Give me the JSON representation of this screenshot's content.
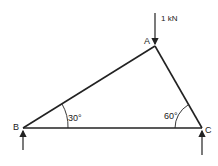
{
  "diagram": {
    "type": "truss",
    "nodes": {
      "A": {
        "label": "A",
        "x": 155,
        "y": 46
      },
      "B": {
        "label": "B",
        "x": 23,
        "y": 128
      },
      "C": {
        "label": "C",
        "x": 202,
        "y": 128
      }
    },
    "members": [
      {
        "from": "A",
        "to": "B"
      },
      {
        "from": "A",
        "to": "C"
      },
      {
        "from": "B",
        "to": "C"
      }
    ],
    "load": {
      "node": "A",
      "label": "1 kN",
      "direction": "down"
    },
    "reactions": [
      {
        "node": "B",
        "direction": "up"
      },
      {
        "node": "C",
        "direction": "up"
      }
    ],
    "angles": [
      {
        "node": "B",
        "label": "30°"
      },
      {
        "node": "C",
        "label": "60°"
      }
    ],
    "colors": {
      "line": "#222222",
      "background": "#ffffff"
    }
  }
}
